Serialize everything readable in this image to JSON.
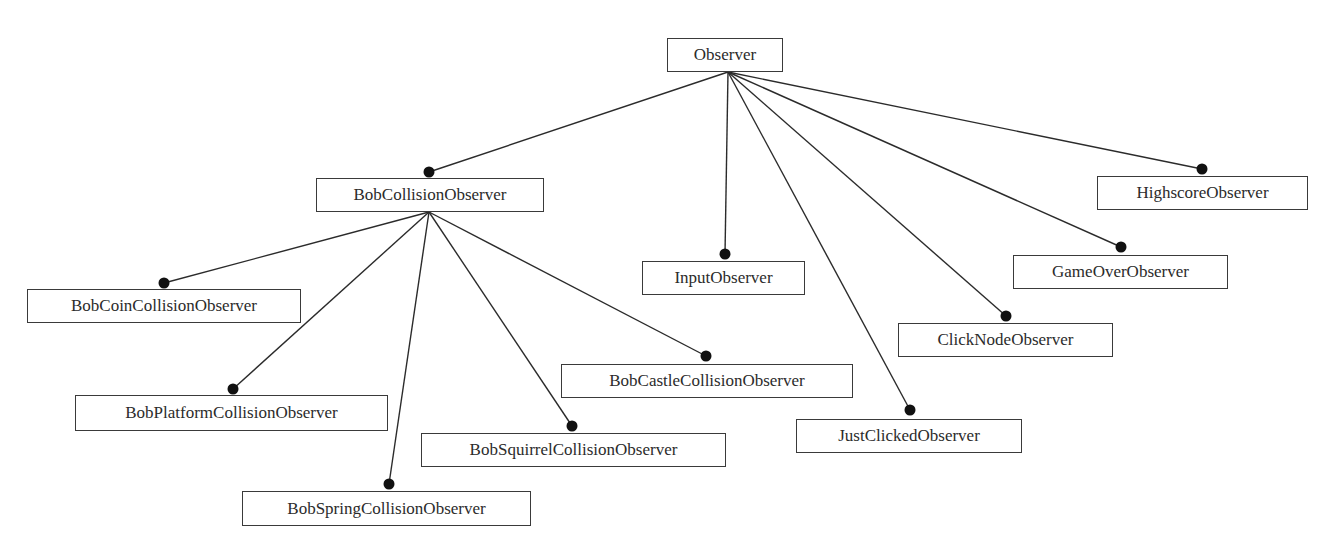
{
  "diagram": {
    "type": "class-hierarchy",
    "colors": {
      "line": "#2b2b2b",
      "dot": "#111111",
      "box_border": "#3a3a3a",
      "text": "#2b2b2b"
    },
    "nodes": [
      {
        "id": "observer",
        "label": "Observer",
        "x": 667,
        "y": 38,
        "w": 116,
        "h": 34
      },
      {
        "id": "bob-collision",
        "label": "BobCollisionObserver",
        "x": 316,
        "y": 178,
        "w": 228,
        "h": 34,
        "parent": "observer"
      },
      {
        "id": "bob-coin",
        "label": "BobCoinCollisionObserver",
        "x": 27,
        "y": 289,
        "w": 274,
        "h": 34,
        "parent": "bob-collision"
      },
      {
        "id": "bob-platform",
        "label": "BobPlatformCollisionObserver",
        "x": 75,
        "y": 395,
        "w": 313,
        "h": 36,
        "parent": "bob-collision"
      },
      {
        "id": "bob-spring",
        "label": "BobSpringCollisionObserver",
        "x": 242,
        "y": 491,
        "w": 289,
        "h": 35,
        "parent": "bob-collision"
      },
      {
        "id": "bob-squirrel",
        "label": "BobSquirrelCollisionObserver",
        "x": 421,
        "y": 433,
        "w": 305,
        "h": 34,
        "parent": "bob-collision"
      },
      {
        "id": "bob-castle",
        "label": "BobCastleCollisionObserver",
        "x": 561,
        "y": 364,
        "w": 292,
        "h": 34,
        "parent": "bob-collision"
      },
      {
        "id": "input",
        "label": "InputObserver",
        "x": 642,
        "y": 261,
        "w": 163,
        "h": 34,
        "parent": "observer"
      },
      {
        "id": "just-clicked",
        "label": "JustClickedObserver",
        "x": 796,
        "y": 419,
        "w": 226,
        "h": 34,
        "parent": "observer"
      },
      {
        "id": "click-node",
        "label": "ClickNodeObserver",
        "x": 898,
        "y": 323,
        "w": 215,
        "h": 34,
        "parent": "observer"
      },
      {
        "id": "game-over",
        "label": "GameOverObserver",
        "x": 1013,
        "y": 255,
        "w": 215,
        "h": 34,
        "parent": "observer"
      },
      {
        "id": "highscore",
        "label": "HighscoreObserver",
        "x": 1097,
        "y": 176,
        "w": 211,
        "h": 34,
        "parent": "observer"
      }
    ],
    "edges": [
      {
        "from": "observer",
        "to": "bob-collision",
        "x1": 728,
        "y1": 72,
        "x2": 429,
        "y2": 172
      },
      {
        "from": "observer",
        "to": "input",
        "x1": 728,
        "y1": 72,
        "x2": 725,
        "y2": 254
      },
      {
        "from": "observer",
        "to": "just-clicked",
        "x1": 728,
        "y1": 72,
        "x2": 910,
        "y2": 410
      },
      {
        "from": "observer",
        "to": "click-node",
        "x1": 728,
        "y1": 72,
        "x2": 1006,
        "y2": 316
      },
      {
        "from": "observer",
        "to": "game-over",
        "x1": 728,
        "y1": 72,
        "x2": 1121,
        "y2": 247
      },
      {
        "from": "observer",
        "to": "highscore",
        "x1": 728,
        "y1": 72,
        "x2": 1202,
        "y2": 169
      },
      {
        "from": "bob-collision",
        "to": "bob-coin",
        "x1": 429,
        "y1": 212,
        "x2": 164,
        "y2": 283
      },
      {
        "from": "bob-collision",
        "to": "bob-platform",
        "x1": 429,
        "y1": 212,
        "x2": 233,
        "y2": 389
      },
      {
        "from": "bob-collision",
        "to": "bob-spring",
        "x1": 429,
        "y1": 212,
        "x2": 389,
        "y2": 484
      },
      {
        "from": "bob-collision",
        "to": "bob-squirrel",
        "x1": 429,
        "y1": 212,
        "x2": 572,
        "y2": 426
      },
      {
        "from": "bob-collision",
        "to": "bob-castle",
        "x1": 429,
        "y1": 212,
        "x2": 706,
        "y2": 356
      }
    ]
  }
}
